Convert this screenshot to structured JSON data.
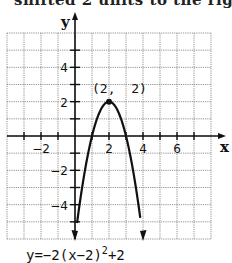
{
  "cropped_header_text": "shifted 2 units to the rig",
  "chart_data": {
    "type": "line",
    "title": "",
    "function": "y=-2(x-2)^2+2",
    "equation_label": {
      "prefix": "y=−2(x−2)",
      "exponent": "2",
      "suffix": "+2"
    },
    "xlabel": "x",
    "ylabel": "y",
    "xlim": [
      -4,
      8
    ],
    "ylim": [
      -6,
      6
    ],
    "grid": true,
    "x_ticks_labeled": [
      "−2",
      "2",
      "4",
      "6"
    ],
    "y_ticks_labeled": [
      "4",
      "2",
      "−2",
      "−4"
    ],
    "x": [
      0,
      0.5,
      1,
      1.5,
      2,
      2.5,
      3,
      3.5,
      4
    ],
    "y": [
      -6,
      -2.5,
      0,
      1.5,
      2,
      1.5,
      0,
      -2.5,
      -6
    ],
    "vertex": {
      "x": 2,
      "y": 2,
      "label": "(2,  2)"
    },
    "arrows_at_ends": true
  }
}
